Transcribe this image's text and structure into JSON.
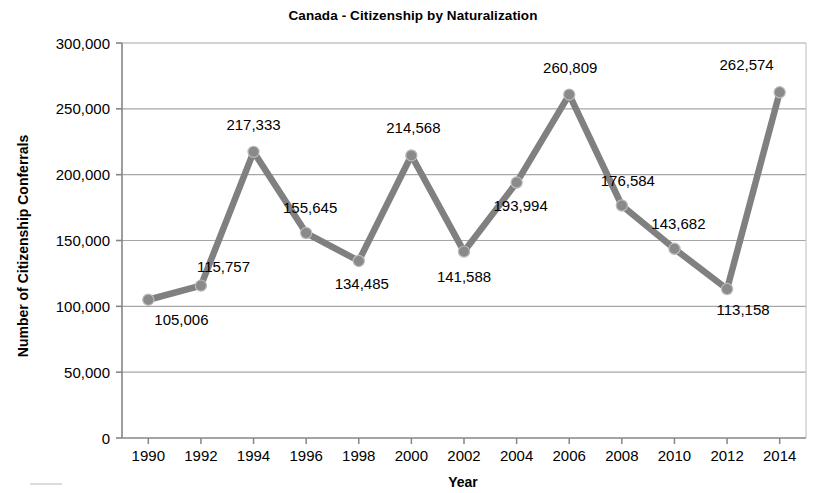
{
  "chart_data": {
    "type": "line",
    "title": "Canada - Citizenship by Naturalization",
    "xlabel": "Year",
    "ylabel": "Number of Citizenship Conferrals",
    "categories": [
      "1990",
      "1992",
      "1994",
      "1996",
      "1998",
      "2000",
      "2002",
      "2004",
      "2006",
      "2008",
      "2010",
      "2012",
      "2014"
    ],
    "values": [
      105006,
      115757,
      217333,
      155645,
      134485,
      214568,
      141588,
      193994,
      260809,
      176584,
      143682,
      113158,
      262574
    ],
    "point_labels": [
      "105,006",
      "115,757",
      "217,333",
      "155,645",
      "134,485",
      "214,568",
      "141,588",
      "193,994",
      "260,809",
      "176,584",
      "143,682",
      "113,158",
      "262,574"
    ],
    "ylim": [
      0,
      300000
    ],
    "ytick_values": [
      0,
      50000,
      100000,
      150000,
      200000,
      250000,
      300000
    ],
    "ytick_labels": [
      "0",
      "50,000",
      "100,000",
      "150,000",
      "200,000",
      "250,000",
      "300,000"
    ],
    "grid": true,
    "grid_axis": "y",
    "legend": false,
    "series_color": "#808080",
    "marker_color": "#8a8a8a",
    "gridline_color": "#a6a6a6",
    "axis_color": "#868686",
    "label_positions": [
      "below",
      "above",
      "above",
      "above",
      "below",
      "above",
      "below",
      "below",
      "above",
      "above",
      "above",
      "below",
      "above"
    ]
  }
}
